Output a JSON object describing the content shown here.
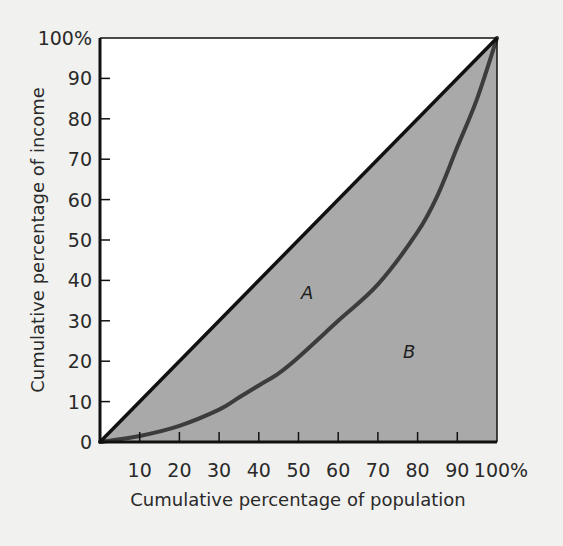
{
  "chart_data": {
    "type": "line",
    "title": "",
    "xlabel": "Cumulative percentage of population",
    "ylabel": "Cumulative percentage of income",
    "xlim": [
      0,
      100
    ],
    "ylim": [
      0,
      100
    ],
    "grid": false,
    "legend": null,
    "x_ticks": [
      "10",
      "20",
      "30",
      "40",
      "50",
      "60",
      "70",
      "80",
      "90",
      "100%"
    ],
    "y_ticks": [
      "0",
      "10",
      "20",
      "30",
      "40",
      "50",
      "60",
      "70",
      "80",
      "90",
      "100%"
    ],
    "series": [
      {
        "name": "Line of equality",
        "style": "solid black",
        "x": [
          0,
          100
        ],
        "y": [
          0,
          100
        ]
      },
      {
        "name": "Lorenz curve",
        "style": "solid dark gray",
        "x": [
          0,
          10,
          20,
          30,
          35,
          40,
          45,
          50,
          60,
          70,
          80,
          85,
          90,
          95,
          100
        ],
        "y": [
          0,
          1.5,
          4,
          8,
          11,
          14,
          17,
          21,
          30,
          39,
          52,
          61,
          73,
          85,
          100
        ]
      }
    ],
    "annotations": [
      {
        "text": "A",
        "x": 52,
        "y": 37,
        "meaning": "area between line of equality and Lorenz curve"
      },
      {
        "text": "B",
        "x": 78,
        "y": 22,
        "meaning": "area under Lorenz curve"
      }
    ],
    "fill": {
      "region": "below diagonal (A + B)",
      "color": "#a9a9a9"
    }
  },
  "labels": {
    "x_title": "Cumulative percentage of population",
    "y_title": "Cumulative percentage of income",
    "region_a": "A",
    "region_b": "B",
    "origin": "0"
  },
  "colors": {
    "background": "#f1f1ef",
    "plot_background": "#ffffff",
    "shaded_area": "#a9a9a9",
    "equality_line": "#111111",
    "lorenz_curve": "#3c3c3c",
    "axis": "#111111"
  }
}
